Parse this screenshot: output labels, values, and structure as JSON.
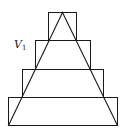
{
  "figure": {
    "label": {
      "main": "V",
      "subscript": "1"
    },
    "stroke_color": "#1a1a1a",
    "background": "#ffffff",
    "triangle": {
      "apex": [
        62,
        12
      ],
      "base_left": [
        8,
        125
      ],
      "base_right": [
        117,
        125
      ]
    },
    "rectangles": [
      {
        "name": "step-1-top",
        "x": 48,
        "y": 12,
        "w": 28,
        "h": 28
      },
      {
        "name": "step-2",
        "x": 35,
        "y": 40,
        "w": 55,
        "h": 29
      },
      {
        "name": "step-3",
        "x": 22,
        "y": 69,
        "w": 81,
        "h": 28
      },
      {
        "name": "step-4-bottom",
        "x": 8,
        "y": 97,
        "w": 109,
        "h": 28
      }
    ]
  }
}
